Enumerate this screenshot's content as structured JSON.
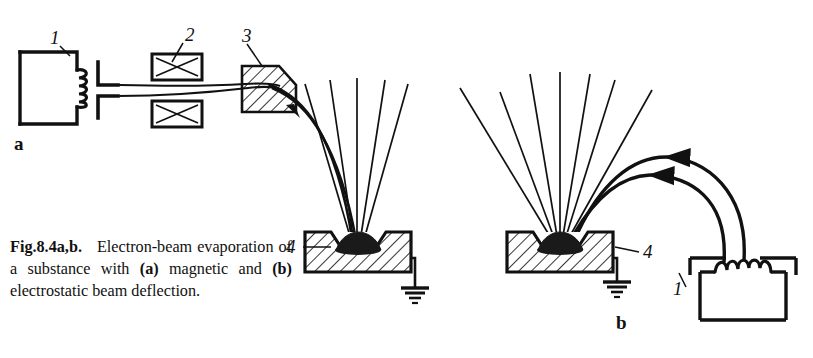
{
  "figure": {
    "caption_lead": "Fig.8.4a,b.",
    "caption_body_1": "Electron-beam evaporation of a substance with ",
    "caption_bold_a": "(a)",
    "caption_body_2": " magnetic and ",
    "caption_bold_b": "(b)",
    "caption_body_3": " electrostatic beam deflection."
  },
  "panels": {
    "a": {
      "letter": "a",
      "name": "magnetic beam deflection",
      "labels": {
        "electron_gun": "1",
        "magnetic_lens": "2",
        "deflector_prism": "3",
        "crucible": "4"
      }
    },
    "b": {
      "letter": "b",
      "name": "electrostatic beam deflection",
      "labels": {
        "crucible": "4",
        "electron_gun": "1"
      }
    }
  },
  "legend_items": [
    {
      "id": "1",
      "meaning": "electron gun with heated filament cathode"
    },
    {
      "id": "2",
      "meaning": "magnetic focusing lens coils"
    },
    {
      "id": "3",
      "meaning": "magnetic deflector prism"
    },
    {
      "id": "4",
      "meaning": "water-cooled crucible with molten substance"
    }
  ],
  "colors": {
    "ink": "#111111",
    "background": "#ffffff",
    "melt_pool": "#1a1a1a"
  }
}
